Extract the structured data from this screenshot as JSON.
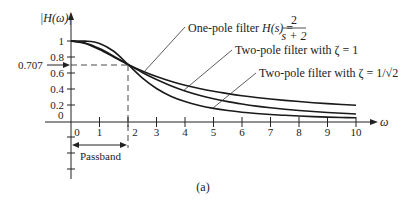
{
  "chart_data": {
    "type": "line",
    "title": "",
    "caption": "(a)",
    "xlabel": "ω",
    "ylabel": "|H(ω)|",
    "xlim": [
      0,
      10
    ],
    "ylim": [
      0,
      1
    ],
    "x_ticks": [
      0,
      1,
      2,
      3,
      4,
      5,
      6,
      7,
      8,
      9,
      10
    ],
    "y_ticks": [
      0,
      0.2,
      0.4,
      0.6,
      0.8,
      1
    ],
    "y_tick_labels": [
      "0",
      "0.2",
      "0.4",
      "0.6",
      "0.8",
      "1"
    ],
    "extra_y_marker": {
      "value": 0.707,
      "label": "0.707"
    },
    "cutoff_x": 2,
    "passband": {
      "from": 0,
      "to": 2,
      "label": "Passband"
    },
    "grid": false,
    "x": [
      0,
      0.5,
      1,
      1.5,
      2,
      2.5,
      3,
      3.5,
      4,
      4.5,
      5,
      5.5,
      6,
      6.5,
      7,
      7.5,
      8,
      8.5,
      9,
      9.5,
      10
    ],
    "series": [
      {
        "name": "One-pole filter H(s) = 2/(s + 2)",
        "values": [
          1,
          0.97,
          0.894,
          0.8,
          0.707,
          0.625,
          0.555,
          0.496,
          0.447,
          0.406,
          0.371,
          0.342,
          0.316,
          0.294,
          0.275,
          0.258,
          0.243,
          0.229,
          0.217,
          0.206,
          0.196
        ]
      },
      {
        "name": "Two-pole filter with ζ = 1",
        "values": [
          1,
          0.975,
          0.906,
          0.811,
          0.707,
          0.607,
          0.518,
          0.441,
          0.376,
          0.323,
          0.279,
          0.242,
          0.212,
          0.186,
          0.165,
          0.147,
          0.131,
          0.118,
          0.107,
          0.097,
          0.088
        ]
      },
      {
        "name": "Two-pole filter with ζ = 1/√2",
        "values": [
          1,
          0.998,
          0.97,
          0.872,
          0.707,
          0.539,
          0.406,
          0.31,
          0.243,
          0.194,
          0.158,
          0.131,
          0.11,
          0.094,
          0.081,
          0.071,
          0.062,
          0.055,
          0.049,
          0.044,
          0.04
        ]
      }
    ]
  },
  "labels": {
    "ylabel": "|H(ω)|",
    "xlabel": "ω",
    "y_0707": "0.707",
    "passband": "Passband",
    "caption": "(a)",
    "one_pole_text": "One-pole filter ",
    "one_pole_H": "H(s)",
    "one_pole_eq": " =",
    "one_pole_num": "2",
    "one_pole_den": "s + 2",
    "two_pole_1": "Two-pole filter with ζ = 1",
    "two_pole_2": "Two-pole filter with ζ = 1/√2"
  },
  "layout": {
    "x0": 71,
    "y0": 121,
    "unit_x": 28.5,
    "unit_y": 80
  }
}
